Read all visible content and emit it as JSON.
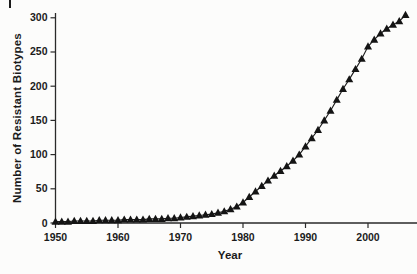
{
  "figure": {
    "xlabel": "Year",
    "ylabel": "Number of Resistant Biotypes"
  },
  "chart_data": {
    "type": "line",
    "title": "",
    "xlabel": "Year",
    "ylabel": "Number of Resistant Biotypes",
    "marker": "filled-triangle-up",
    "legend": "none",
    "grid": false,
    "xlim": [
      1950,
      2008
    ],
    "ylim": [
      0,
      307
    ],
    "x_ticks": [
      1950,
      1960,
      1970,
      1980,
      1990,
      2000
    ],
    "y_ticks": [
      0,
      50,
      100,
      150,
      200,
      250,
      300
    ],
    "colors": {
      "line": "#1c1c1c",
      "marker": "#141414",
      "axis": "#2a2a2a",
      "text": "#1b1b1b",
      "background": "#fcfcfb"
    },
    "series": [
      {
        "name": "Resistant biotypes",
        "x": [
          1950,
          1951,
          1952,
          1953,
          1954,
          1955,
          1956,
          1957,
          1958,
          1959,
          1960,
          1961,
          1962,
          1963,
          1964,
          1965,
          1966,
          1967,
          1968,
          1969,
          1970,
          1971,
          1972,
          1973,
          1974,
          1975,
          1976,
          1977,
          1978,
          1979,
          1980,
          1981,
          1982,
          1983,
          1984,
          1985,
          1986,
          1987,
          1988,
          1989,
          1990,
          1991,
          1992,
          1993,
          1994,
          1995,
          1996,
          1997,
          1998,
          1999,
          2000,
          2001,
          2002,
          2003,
          2004,
          2005,
          2006
        ],
        "values": [
          2,
          2,
          2,
          3,
          3,
          3,
          3,
          4,
          4,
          4,
          4,
          5,
          5,
          5,
          5,
          6,
          6,
          6,
          7,
          7,
          8,
          9,
          10,
          11,
          12,
          13,
          15,
          17,
          20,
          24,
          30,
          38,
          46,
          54,
          62,
          69,
          76,
          83,
          91,
          100,
          112,
          124,
          136,
          150,
          164,
          180,
          196,
          210,
          225,
          240,
          258,
          268,
          277,
          284,
          290,
          295,
          304
        ]
      }
    ]
  }
}
